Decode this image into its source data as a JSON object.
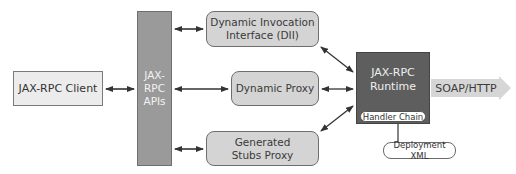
{
  "diagram": {
    "nodes": {
      "client": {
        "label": "JAX-RPC Client"
      },
      "apis": {
        "line1": "JAX-",
        "line2": "RPC",
        "line3": "APIs"
      },
      "dii": {
        "line1": "Dynamic Invocation",
        "line2": "Interface (DII)"
      },
      "dynamic_proxy": {
        "label": "Dynamic Proxy"
      },
      "stubs": {
        "line1": "Generated",
        "line2": "Stubs Proxy"
      },
      "runtime": {
        "line1": "JAX-RPC",
        "line2": "Runtime",
        "handler": "Handler Chain"
      },
      "deployment": {
        "label": "Deployment XML"
      },
      "soap": {
        "label": "SOAP/HTTP"
      }
    },
    "edges": [
      {
        "from": "JAX-RPC Client",
        "to": "JAX-RPC APIs",
        "type": "bidirectional"
      },
      {
        "from": "JAX-RPC APIs",
        "to": "Dynamic Invocation Interface (DII)",
        "type": "bidirectional"
      },
      {
        "from": "JAX-RPC APIs",
        "to": "Dynamic Proxy",
        "type": "bidirectional"
      },
      {
        "from": "JAX-RPC APIs",
        "to": "Generated Stubs Proxy",
        "type": "bidirectional"
      },
      {
        "from": "Dynamic Invocation Interface (DII)",
        "to": "JAX-RPC Runtime",
        "type": "bidirectional"
      },
      {
        "from": "Dynamic Proxy",
        "to": "JAX-RPC Runtime",
        "type": "bidirectional"
      },
      {
        "from": "Generated Stubs Proxy",
        "to": "JAX-RPC Runtime",
        "type": "bidirectional"
      },
      {
        "from": "JAX-RPC Runtime",
        "to": "Deployment XML",
        "type": "line"
      },
      {
        "from": "JAX-RPC Runtime",
        "to": "SOAP/HTTP",
        "type": "outbound-arrow"
      }
    ],
    "colors": {
      "client_fill": "#ececec",
      "apis_fill": "#9a9a9a",
      "component_fill": "#d4d4d4",
      "runtime_fill": "#5e5e5e",
      "soap_arrow_fill": "#d6d6d6",
      "line": "#333333"
    }
  }
}
